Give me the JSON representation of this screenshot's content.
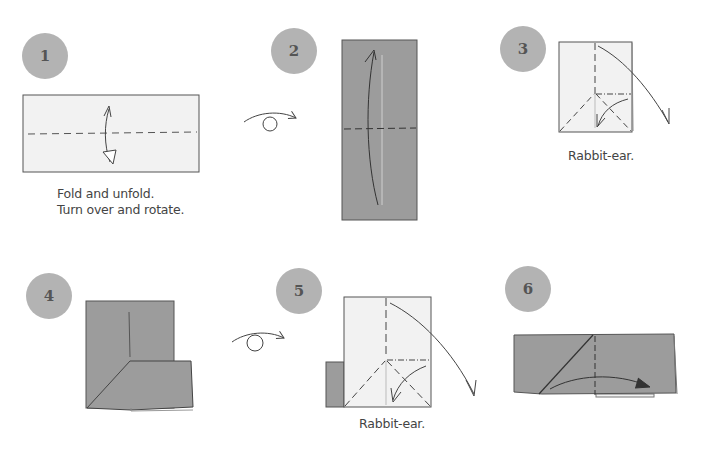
{
  "colors": {
    "paper_white": "#f2f2f2",
    "paper_colored": "#9c9c9c",
    "badge": "#b3b3b3",
    "badge_text": "#555555",
    "line": "#444444",
    "caption_text": "#444444"
  },
  "steps": [
    {
      "number": "1",
      "caption_lines": [
        "Fold and unfold.",
        "Turn over and rotate."
      ]
    },
    {
      "number": "2",
      "caption_lines": []
    },
    {
      "number": "3",
      "caption_lines": [
        "Rabbit-ear."
      ]
    },
    {
      "number": "4",
      "caption_lines": []
    },
    {
      "number": "5",
      "caption_lines": [
        "Rabbit-ear."
      ]
    },
    {
      "number": "6",
      "caption_lines": []
    }
  ],
  "symbols": [
    {
      "type": "turn-over-icon",
      "between_steps": "1-2"
    },
    {
      "type": "turn-over-icon",
      "between_steps": "4-5"
    }
  ]
}
